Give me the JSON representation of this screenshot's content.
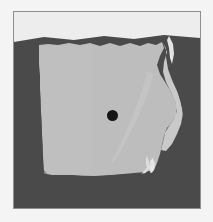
{
  "figure": {
    "kind": "map",
    "title": "Egypt",
    "projection_note": "",
    "background_color": "#f4f4f4",
    "frame_color": "#8f8f8f"
  },
  "legend": {
    "land_label": "Land (Egypt)",
    "land_color": "#bdbdbd",
    "surrounding_label": "Surrounding territory / sea",
    "surrounding_color": "#4a4a4a",
    "sea_label": "Mediterranean Sea",
    "sea_color": "#ededed",
    "water_label": "Nile / Lake Nasser",
    "water_color": "#e6e6e6",
    "marker_label": "Cairo",
    "marker_color": "#151515"
  },
  "markers": [
    {
      "name": "Cairo",
      "type": "capital-city-dot",
      "x_pct": 52.9,
      "y_pct": 53.0,
      "radius_px": 5.5,
      "color": "#151515"
    }
  ],
  "regions": [
    {
      "name": "Egypt mainland",
      "color": "#bdbdbd"
    },
    {
      "name": "Mediterranean Sea",
      "color": "#ededed"
    },
    {
      "name": "Neighbouring land and Red Sea",
      "color": "#4a4a4a"
    },
    {
      "name": "Gulf of Suez / Red Sea inlet",
      "color": "#c9c9c9"
    },
    {
      "name": "Lake Nasser and Nile",
      "color": "#e6e6e6"
    }
  ],
  "accessibility": {
    "alt_text": "Grayscale map of Egypt with a black dot marking Cairo near the centre."
  }
}
